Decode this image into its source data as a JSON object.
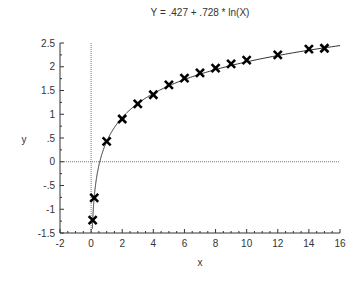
{
  "chart_data": {
    "type": "scatter",
    "title": "Y = .427 + .728 * ln(X)",
    "xlabel": "x",
    "ylabel": "y",
    "xlim": [
      -2,
      16
    ],
    "ylim": [
      -1.5,
      2.5
    ],
    "x_ticks": [
      -2,
      0,
      2,
      4,
      6,
      8,
      10,
      12,
      14,
      16
    ],
    "x_tick_labels": [
      "-2",
      "0",
      "2",
      "4",
      "6",
      "8",
      "10",
      "12",
      "14",
      "16"
    ],
    "y_ticks": [
      -1.5,
      -1,
      -0.5,
      0,
      0.5,
      1,
      1.5,
      2,
      2.5
    ],
    "y_tick_labels": [
      "-1.5",
      "-1",
      "-.5",
      "0",
      ".5",
      "1",
      "1.5",
      "2",
      "2.5"
    ],
    "x_minor_step": 0.5,
    "y_minor_step": 0.25,
    "reference_lines": {
      "x_zero": true,
      "y_zero": true,
      "style": "dotted"
    },
    "grid": false,
    "legend": "none",
    "fit_curve": {
      "intercept": 0.427,
      "slope": 0.728,
      "function": "ln",
      "x_range": [
        0.08,
        16
      ]
    },
    "series": [
      {
        "name": "observed",
        "marker": "x",
        "x": [
          0.1,
          0.2,
          1,
          2,
          3,
          4,
          5,
          6,
          7,
          8,
          9,
          10,
          12,
          14,
          15
        ],
        "y": [
          -1.23,
          -0.76,
          0.43,
          0.9,
          1.22,
          1.41,
          1.62,
          1.76,
          1.87,
          1.97,
          2.06,
          2.14,
          2.25,
          2.37,
          2.39
        ]
      }
    ],
    "colors": {
      "axis": "#333333",
      "marker": "#000000",
      "curve": "#333333",
      "reference": "#777777"
    }
  }
}
